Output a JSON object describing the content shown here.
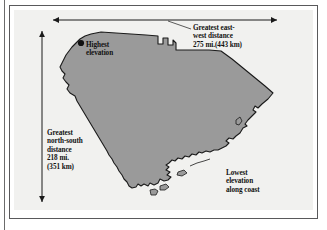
{
  "figure": {
    "kind": "map-diagram",
    "colors": {
      "panel_background": "#f1f1ef",
      "state_fill": "#9a9a9a",
      "state_outline": "#1a1a1a",
      "frame": "#59595b",
      "text": "#111111",
      "arrow": "#1a1a1a"
    }
  },
  "annotations": {
    "east_west": {
      "name": "greatest-east-west-distance",
      "text": "Greatest east-\nwest distance\n275 mi.(443 km)",
      "miles": "275 mi.",
      "kilometers": "(443 km)"
    },
    "north_south": {
      "name": "greatest-north-south-distance",
      "text": "Greatest\nnorth-south\ndistance\n218 mi.\n(351 km)",
      "miles": "218 mi.",
      "kilometers": "(351 km)"
    },
    "highest_elevation": {
      "name": "highest-elevation",
      "text": "Highest\nelevation"
    },
    "lowest_elevation": {
      "name": "lowest-elevation",
      "text": "Lowest\nelevation\nalong coast"
    }
  },
  "markers": {
    "highest_elevation_point": {
      "cx": 81,
      "cy": 43,
      "r": 3.1
    }
  },
  "measure_arrows": [
    {
      "name": "east-west-arrow",
      "orientation": "horizontal",
      "x1": 53,
      "y1": 20,
      "x2": 277,
      "y2": 20
    },
    {
      "name": "north-south-arrow",
      "orientation": "vertical",
      "x1": 42,
      "y1": 31,
      "x2": 42,
      "y2": 202
    }
  ],
  "leader_lines": [
    {
      "name": "east-west-leader",
      "x1": 191,
      "y1": 28,
      "x2": 169,
      "y2": 22
    }
  ]
}
